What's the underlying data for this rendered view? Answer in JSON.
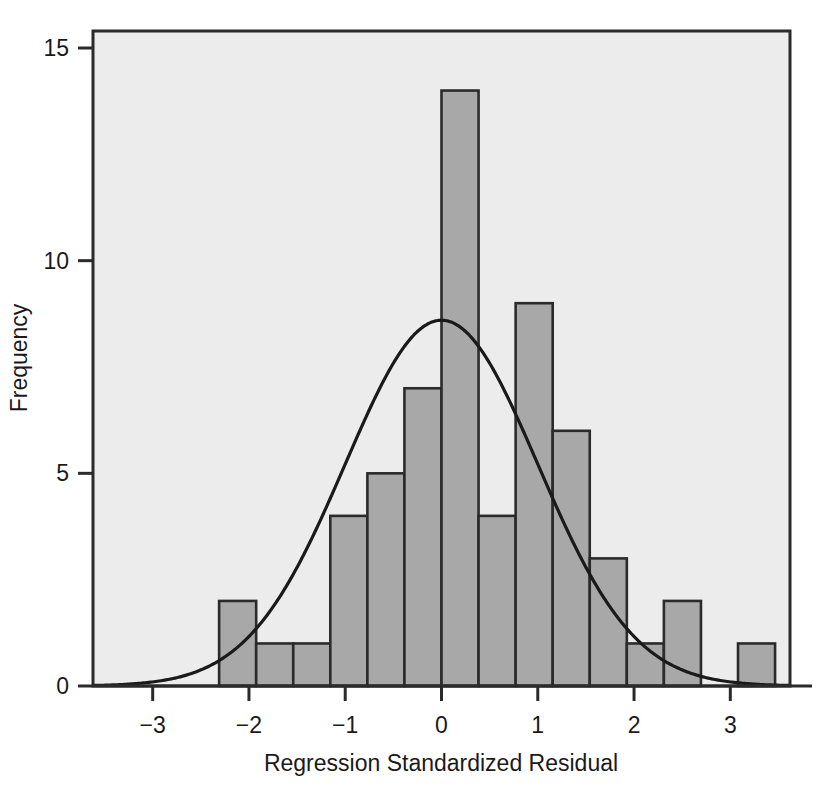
{
  "chart_data": {
    "type": "bar",
    "title": "",
    "subtitle": "",
    "xlabel": "Regression Standardized Residual",
    "ylabel": "Frequency",
    "xlim": [
      -3.62,
      3.62
    ],
    "ylim": [
      0,
      15.4
    ],
    "xticks": [
      -3,
      -2,
      -1,
      0,
      1,
      2,
      3
    ],
    "xtick_labels": [
      "−3",
      "−2",
      "−1",
      "0",
      "1",
      "2",
      "3"
    ],
    "yticks": [
      0,
      5,
      10,
      15
    ],
    "ytick_labels": [
      "0",
      "5",
      "10",
      "15"
    ],
    "grid": false,
    "legend": false,
    "bin_width": 0.385,
    "bin_lefts": [
      -2.31,
      -1.925,
      -1.54,
      -1.155,
      -0.77,
      -0.385,
      0.0,
      0.385,
      0.77,
      1.155,
      1.54,
      1.925,
      2.31,
      2.695
    ],
    "categories": [
      "-2.31 to -1.93",
      "-1.93 to -1.54",
      "-1.54 to -1.16",
      "-1.16 to -0.77",
      "-0.77 to -0.39",
      "-0.39 to 0.00",
      "0.00 to 0.39",
      "0.39 to 0.77",
      "0.77 to 1.16",
      "1.16 to 1.54",
      "1.54 to 1.93",
      "1.93 to 2.31",
      "2.31 to 2.70",
      "2.70 to 3.08"
    ],
    "values": [
      2,
      1,
      1,
      4,
      5,
      7,
      14,
      4,
      9,
      6,
      3,
      1,
      2,
      0
    ],
    "bars": [
      {
        "left": -2.31,
        "value": 2
      },
      {
        "left": -1.925,
        "value": 1
      },
      {
        "left": -1.54,
        "value": 1
      },
      {
        "left": -1.155,
        "value": 4
      },
      {
        "left": -0.77,
        "value": 5
      },
      {
        "left": -0.385,
        "value": 7
      },
      {
        "left": 0.0,
        "value": 14
      },
      {
        "left": 0.385,
        "value": 4
      },
      {
        "left": 0.77,
        "value": 9
      },
      {
        "left": 1.155,
        "value": 6
      },
      {
        "left": 1.54,
        "value": 3
      },
      {
        "left": 1.925,
        "value": 1
      },
      {
        "left": 2.31,
        "value": 2
      },
      {
        "left": 3.08,
        "value": 1
      }
    ],
    "overlay_curve": {
      "name": "Normal curve",
      "type": "normal",
      "mean": 0.0,
      "std_dev": 1.0,
      "peak_value": 8.6
    },
    "n_total": 56,
    "colors": {
      "bar_fill": "#a8a8a8",
      "bar_edge": "#2b2b2b",
      "plot_background": "#ececec",
      "frame": "#2b2b2b",
      "curve": "#1a1a1a",
      "text": "#1a1a1a"
    }
  }
}
